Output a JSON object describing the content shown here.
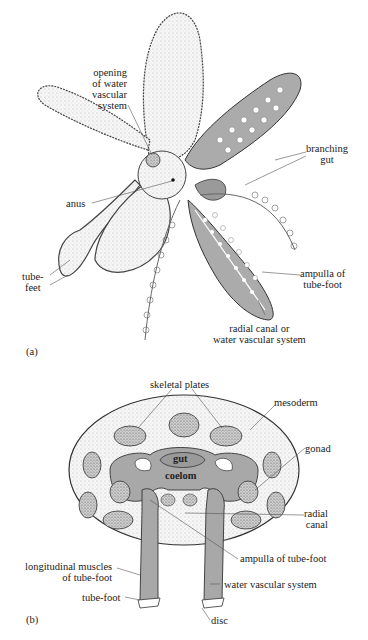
{
  "figure": {
    "panel_a": {
      "tag": "(a)",
      "labels": {
        "opening_line1": "opening",
        "opening_line2": "of water",
        "opening_line3": "vascular",
        "opening_line4": "system",
        "branching_line1": "branching",
        "branching_line2": "gut",
        "anus": "anus",
        "tube_feet_line1": "tube-",
        "tube_feet_line2": "feet",
        "ampulla_line1": "ampulla of",
        "ampulla_line2": "tube-foot",
        "radial_line1": "radial canal or",
        "radial_line2": "water vascular system"
      }
    },
    "panel_b": {
      "tag": "(b)",
      "labels": {
        "skeletal_plates": "skeletal plates",
        "mesoderm": "mesoderm",
        "gonad": "gonad",
        "gut": "gut",
        "coelom": "coelom",
        "radial_line1": "radial",
        "radial_line2": "canal",
        "ampulla": "ampulla of tube-foot",
        "longitudinal_line1": "longitudinal muscles",
        "longitudinal_line2": "of tube-foot",
        "water_vascular": "water vascular system",
        "tube_foot": "tube-foot",
        "disc": "disc"
      }
    },
    "colors": {
      "tissue_gray": "#a8a8a8",
      "stipple_light": "#f2f2f2",
      "outline": "#333333"
    }
  }
}
